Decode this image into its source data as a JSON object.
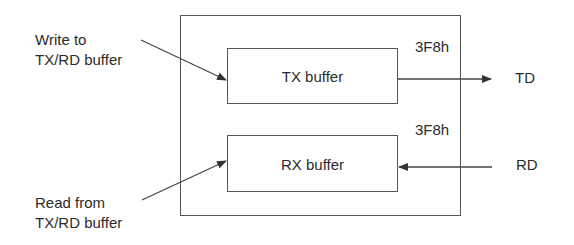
{
  "diagram": {
    "type": "block-diagram",
    "outer_block": {
      "label": ""
    },
    "blocks": [
      {
        "id": "tx",
        "label": "TX buffer",
        "address": "3F8h"
      },
      {
        "id": "rx",
        "label": "RX buffer",
        "address": "3F8h"
      }
    ],
    "inputs": {
      "write": {
        "line1": "Write to",
        "line2": "TX/RD buffer"
      },
      "read": {
        "line1": "Read from",
        "line2": "TX/RD buffer"
      }
    },
    "signals": {
      "td": "TD",
      "rd": "RD"
    },
    "edges": [
      {
        "from": "write",
        "to": "tx"
      },
      {
        "from": "tx",
        "to": "td"
      },
      {
        "from": "rd",
        "to": "rx"
      },
      {
        "from": "rx",
        "to": "read"
      }
    ],
    "colors": {
      "line": "#555555",
      "text": "#2b2b2b",
      "background": "#ffffff"
    }
  }
}
